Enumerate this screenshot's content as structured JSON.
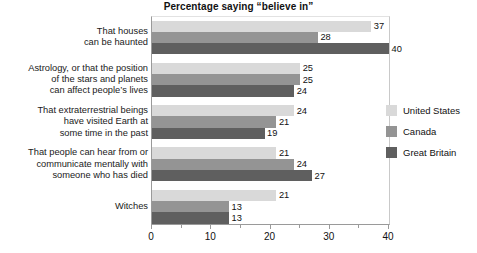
{
  "chart_data": {
    "type": "bar",
    "orientation": "horizontal",
    "title": "Percentage saying “believe in”",
    "xlabel": "",
    "ylabel": "",
    "xlim": [
      0,
      40
    ],
    "xticks": [
      0,
      10,
      20,
      30,
      40
    ],
    "xtick_labels": [
      "0",
      "10",
      "20",
      "30",
      "40"
    ],
    "grid": false,
    "legend_position": "right",
    "categories": [
      "That houses\ncan be haunted",
      "Astrology, or that the position\nof the stars and planets\ncan affect people’s lives",
      "That extraterrestrial beings\nhave visited Earth at\nsome time in the past",
      "That people can hear from or\ncommunicate mentally with\nsomeone who has died",
      "Witches"
    ],
    "series": [
      {
        "name": "United States",
        "color": "#d9d9d9",
        "values": [
          37,
          25,
          24,
          21,
          21
        ]
      },
      {
        "name": "Canada",
        "color": "#949494",
        "values": [
          28,
          25,
          21,
          24,
          13
        ]
      },
      {
        "name": "Great Britain",
        "color": "#5f5f5f",
        "values": [
          40,
          24,
          19,
          27,
          13
        ]
      }
    ]
  },
  "categories_lines": [
    [
      "That houses",
      "can be haunted"
    ],
    [
      "Astrology, or that the position",
      "of the stars and planets",
      "can affect people’s lives"
    ],
    [
      "That extraterrestrial beings",
      "have visited Earth at",
      "some time in the past"
    ],
    [
      "That people can hear from or",
      "communicate mentally with",
      "someone who has died"
    ],
    [
      "Witches"
    ]
  ],
  "legend": {
    "items": [
      {
        "label": "United States",
        "color": "#d9d9d9"
      },
      {
        "label": "Canada",
        "color": "#949494"
      },
      {
        "label": "Great Britain",
        "color": "#5f5f5f"
      }
    ]
  },
  "axis": {
    "ticks": [
      {
        "label": "0",
        "value": 0
      },
      {
        "label": "10",
        "value": 10
      },
      {
        "label": "20",
        "value": 20
      },
      {
        "label": "30",
        "value": 30
      },
      {
        "label": "40",
        "value": 40
      }
    ]
  }
}
